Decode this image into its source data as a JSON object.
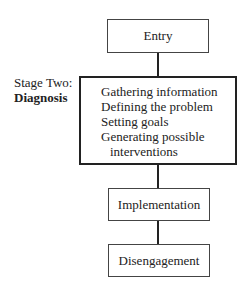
{
  "diagram": {
    "nodes": {
      "entry": "Entry",
      "diagnosis": {
        "stage_label": "Stage Two:",
        "stage_name": "Diagnosis",
        "items": [
          "Gathering information",
          "Defining the problem",
          "Setting goals",
          "Generating possible"
        ],
        "items_continuation": "interventions"
      },
      "implementation": "Implementation",
      "disengagement": "Disengagement"
    },
    "edges": [
      [
        "Entry",
        "Diagnosis"
      ],
      [
        "Diagnosis",
        "Implementation"
      ],
      [
        "Implementation",
        "Disengagement"
      ]
    ]
  }
}
